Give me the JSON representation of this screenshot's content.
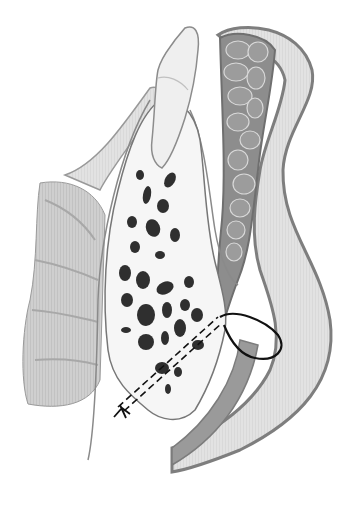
{
  "figure": {
    "kind": "grayscale anatomical illustration",
    "colors": {
      "background": "#ffffff",
      "outline": "#7a7a7a",
      "muscle_dark": "#8a8a8a",
      "muscle_light": "#c8c8c8",
      "soft_tissue": "#dcdcdc",
      "bone": "#f7f7f7",
      "marrow": "#2e2e2e",
      "tooth": "#ececec",
      "suture": "#111111"
    },
    "signature": ""
  }
}
